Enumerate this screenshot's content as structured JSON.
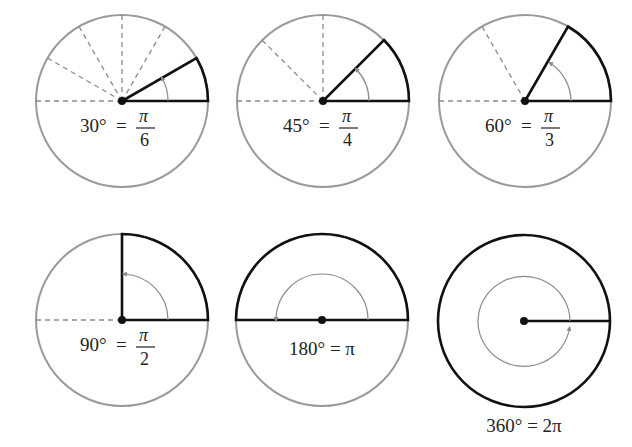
{
  "colors": {
    "circle": "#9a9a9a",
    "bold": "#111111",
    "dashed": "#8a8a8a",
    "arrow": "#8a8a8a"
  },
  "diagrams": [
    {
      "degrees": "30°",
      "eq": "=",
      "num": "π",
      "den": "6",
      "angle_deg": 30
    },
    {
      "degrees": "45°",
      "eq": "=",
      "num": "π",
      "den": "4",
      "angle_deg": 45
    },
    {
      "degrees": "60°",
      "eq": "=",
      "num": "π",
      "den": "3",
      "angle_deg": 60
    },
    {
      "degrees": "90°",
      "eq": "=",
      "num": "π",
      "den": "2",
      "angle_deg": 90
    },
    {
      "label": "180° = π",
      "angle_deg": 180
    },
    {
      "label": "360° = 2π",
      "angle_deg": 360
    }
  ]
}
